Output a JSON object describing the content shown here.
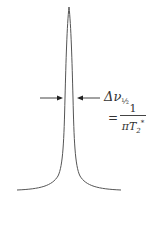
{
  "diagram": {
    "title": "",
    "peak_shape": "lorentzian",
    "linewidth_label": {
      "symbol": "Δν",
      "subscript": "½"
    },
    "equation": {
      "equals": "=",
      "numerator": "1",
      "denominator_prefix": "πT",
      "denominator_subscript": "2",
      "denominator_superscript": "*"
    },
    "colors": {
      "line": "#555555",
      "text": "#333333",
      "background": "#ffffff"
    }
  }
}
